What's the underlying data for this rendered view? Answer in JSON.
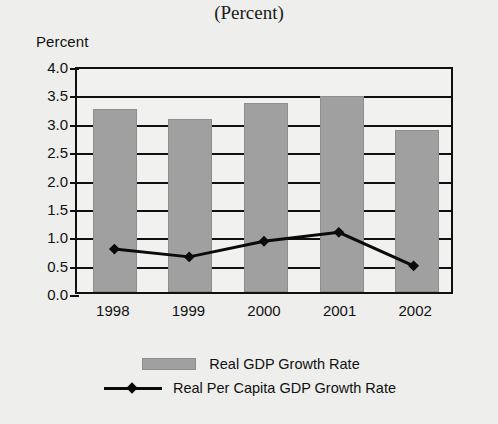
{
  "chart_data": {
    "type": "bar",
    "title": "",
    "subtitle": "(Percent)",
    "xlabel": "",
    "ylabel": "Percent",
    "categories": [
      "1998",
      "1999",
      "2000",
      "2001",
      "2002"
    ],
    "ylim": [
      0.0,
      4.0
    ],
    "ytick_labels": [
      "4.0",
      "3.5",
      "3.0",
      "2.5",
      "2.0",
      "1.5",
      "1.0",
      "0.5",
      "0.0"
    ],
    "ytick_values": [
      4.0,
      3.5,
      3.0,
      2.5,
      2.0,
      1.5,
      1.0,
      0.5,
      0.0
    ],
    "grid": true,
    "legend_position": "bottom",
    "series": [
      {
        "name": "Real GDP Growth Rate",
        "type": "bar",
        "color": "#a0a0a0",
        "values": [
          3.22,
          3.05,
          3.33,
          3.46,
          2.85
        ]
      },
      {
        "name": "Real Per Capita GDP Growth Rate",
        "type": "line",
        "color": "#0a0a0a",
        "marker": "diamond",
        "values": [
          0.77,
          0.63,
          0.91,
          1.07,
          0.47
        ]
      }
    ]
  },
  "legend": {
    "bar_label": "Real GDP Growth Rate",
    "line_label": "Real Per Capita GDP Growth Rate"
  }
}
